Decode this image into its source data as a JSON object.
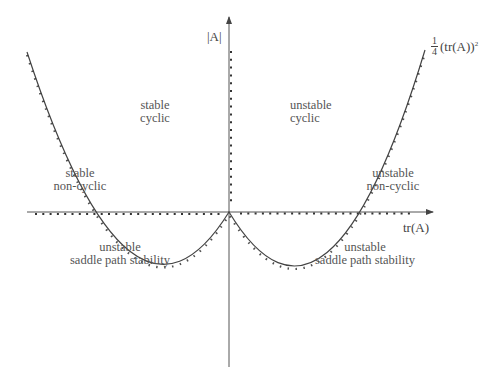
{
  "diagram": {
    "type": "stability-regions",
    "axes": {
      "x_label": "tr(A)",
      "y_label": "|A|"
    },
    "curve_label": {
      "frac_num": "1",
      "frac_den": "4",
      "expr": "(tr(A))",
      "exponent": "2"
    },
    "regions": {
      "stable_cyclic": {
        "line1": "stable",
        "line2": "cyclic"
      },
      "unstable_cyclic": {
        "line1": "unstable",
        "line2": "cyclic"
      },
      "stable_noncyclic": {
        "line1": "stable",
        "line2": "non-cyclic"
      },
      "unstable_noncyclic": {
        "line1": "unstable",
        "line2": "non-cyclic"
      },
      "saddle_left": {
        "line1": "unstable",
        "line2": "saddle path stability"
      },
      "saddle_right": {
        "line1": "unstable",
        "line2": "saddle path stability"
      }
    },
    "colors": {
      "line": "#444444",
      "text": "#555555",
      "background": "#ffffff"
    }
  }
}
